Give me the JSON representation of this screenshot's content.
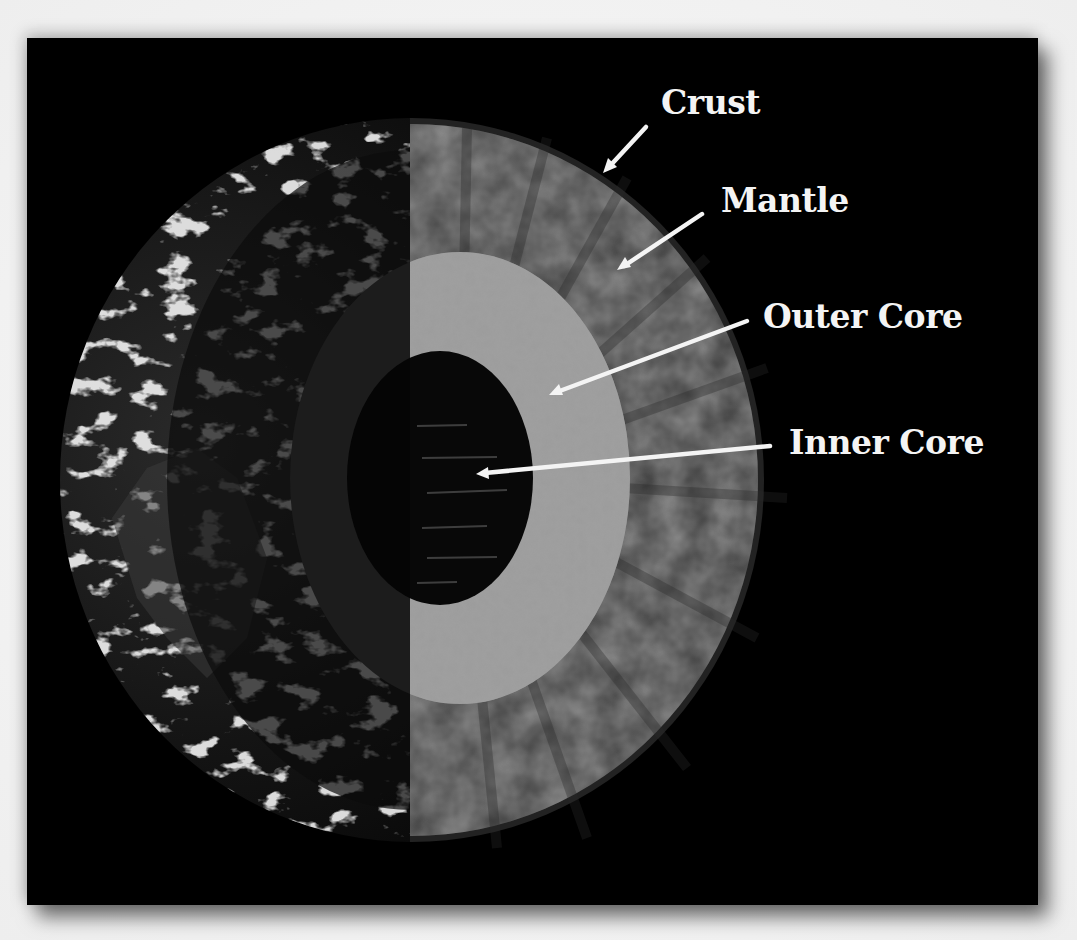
{
  "diagram": {
    "background_color": "#000000",
    "layers": [
      {
        "name": "Crust",
        "color": "#2c2c2c"
      },
      {
        "name": "Mantle",
        "color": "#4a4a4a"
      },
      {
        "name": "Outer Core",
        "color": "#9a9a9a"
      },
      {
        "name": "Inner Core",
        "color": "#0a0a0a"
      }
    ],
    "labels": {
      "crust": "Crust",
      "mantle": "Mantle",
      "outer_core": "Outer Core",
      "inner_core": "Inner Core"
    },
    "arrow_color": "#f4f4f4"
  }
}
